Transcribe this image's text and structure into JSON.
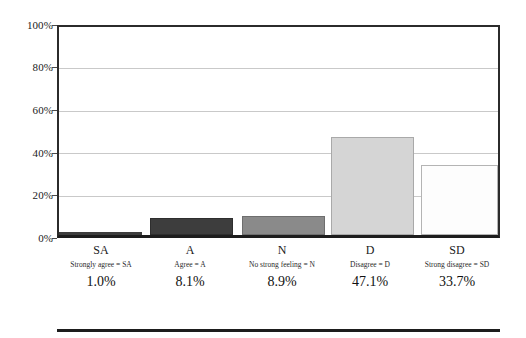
{
  "chart_data": {
    "type": "bar",
    "title": "",
    "subtitle": "",
    "xlabel": "",
    "ylabel": "",
    "ylim": [
      0,
      100
    ],
    "grid": true,
    "legend": "none",
    "categories": [
      "SA",
      "A",
      "N",
      "D",
      "SD"
    ],
    "values": [
      1.0,
      8.1,
      8.9,
      47.1,
      33.7
    ],
    "value_labels": [
      "1.0%",
      "8.1%",
      "8.9%",
      "47.1%",
      "33.7%"
    ],
    "category_keys": [
      "Strongly agree = SA",
      "Agree = A",
      "No strong feeling = N",
      "Disagree = D",
      "Strong disagree = SD"
    ],
    "bar_colors": [
      "#3d3d3d",
      "#3d3d3d",
      "#8a8a8a",
      "#d5d5d5",
      "#fdfdfd"
    ],
    "bar_border_colors": [
      "#3d3d3d",
      "#2e2e2e",
      "#6e6e6e",
      "#a9a9a9",
      "#b4b4b4"
    ],
    "yticks": [
      {
        "label": "100%",
        "value": 100
      },
      {
        "label": "80%",
        "value": 80
      },
      {
        "label": "60%",
        "value": 60
      },
      {
        "label": "40%",
        "value": 40
      },
      {
        "label": "20%",
        "value": 20
      },
      {
        "label": "0%",
        "value": 0
      }
    ],
    "axis_color": "#2b2b2b",
    "gridline_color": "#c9c9c9",
    "background_color": "#ffffff"
  }
}
